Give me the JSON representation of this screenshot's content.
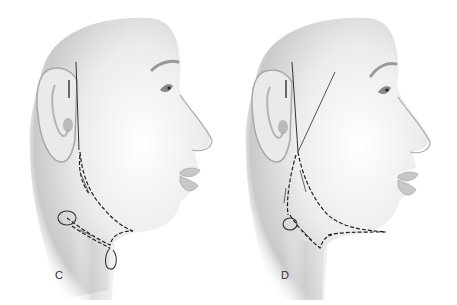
{
  "figure": {
    "panels": [
      {
        "id": "C",
        "label": "C",
        "description": "Lateral head profile with dashed suture path running from preauricular region down the jawline to the neck, with loop anchors below the mandible"
      },
      {
        "id": "D",
        "label": "D",
        "description": "Lateral head profile with two solid vector lines above the ear and dashed suture path along the mandibular border to the submental region with a loop anchor"
      }
    ],
    "colors": {
      "skin_light": "#f4f4f4",
      "skin_shadow": "#bdbdbd",
      "line": "#222222",
      "background": "#ffffff"
    }
  }
}
